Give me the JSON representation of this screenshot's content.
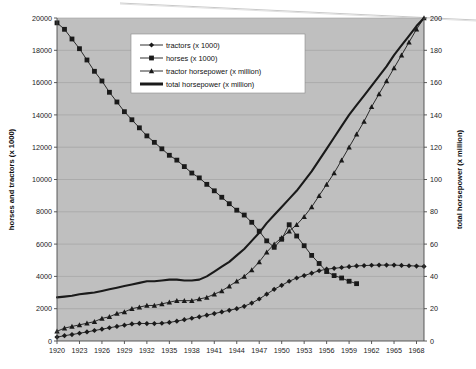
{
  "figure": {
    "name": "farm-power-chart",
    "background": "#ffffff",
    "plot_background": "#bfbfbf",
    "line_color": "#1a1a1a",
    "grid_color": "#9e9e9e",
    "axis_color": "#4a4a4a"
  },
  "legend": {
    "position": "top-center-inside",
    "background": "#ffffff",
    "items": [
      {
        "label": "tractors (x 1000)",
        "marker": "diamond-marker",
        "series": "tractors"
      },
      {
        "label": "horses (x 1000)",
        "marker": "square-marker",
        "series": "horses"
      },
      {
        "label": "tractor horsepower (x million)",
        "marker": "triangle-marker",
        "series": "tractor_horsepower"
      },
      {
        "label": "total horsepower (x million)",
        "marker": "thick-line-marker",
        "series": "total_horsepower"
      }
    ]
  },
  "chart_data": {
    "type": "line",
    "title": "",
    "subtitle": "",
    "xlabel": "",
    "ylabel": "horses and tractors (x 1000)",
    "y2label": "total horsepower (x million)",
    "ylim": [
      0,
      20000
    ],
    "y2lim": [
      0,
      200
    ],
    "xlim": [
      1920,
      1969
    ],
    "grid": true,
    "grid_axis": "y",
    "legend_position": "upper center",
    "y_ticks": [
      0,
      2000,
      4000,
      6000,
      8000,
      10000,
      12000,
      14000,
      16000,
      18000,
      20000
    ],
    "y_tick_labels": [
      "0",
      "2000",
      "4000",
      "6000",
      "8000",
      "10000",
      "12000",
      "14000",
      "16000",
      "18000",
      "20000"
    ],
    "y2_ticks": [
      0,
      20,
      40,
      60,
      80,
      100,
      120,
      140,
      160,
      180,
      200
    ],
    "y2_tick_labels": [
      "0",
      "20",
      "40",
      "60",
      "80",
      "100",
      "120",
      "140",
      "160",
      "180",
      "200"
    ],
    "x_tick_labels": [
      "1920",
      "1923",
      "1926",
      "1929",
      "1932",
      "1935",
      "1938",
      "1941",
      "1944",
      "1947",
      "1950",
      "1953",
      "1956",
      "1959",
      "1962",
      "1965",
      "1968"
    ],
    "x_tick_values": [
      1920,
      1923,
      1926,
      1929,
      1932,
      1935,
      1938,
      1941,
      1944,
      1947,
      1950,
      1953,
      1956,
      1959,
      1962,
      1965,
      1968
    ],
    "x": [
      1920,
      1921,
      1922,
      1923,
      1924,
      1925,
      1926,
      1927,
      1928,
      1929,
      1930,
      1931,
      1932,
      1933,
      1934,
      1935,
      1936,
      1937,
      1938,
      1939,
      1940,
      1941,
      1942,
      1943,
      1944,
      1945,
      1946,
      1947,
      1948,
      1949,
      1950,
      1951,
      1952,
      1953,
      1954,
      1955,
      1956,
      1957,
      1958,
      1959,
      1960,
      1961,
      1962,
      1963,
      1964,
      1965,
      1966,
      1967,
      1968,
      1969
    ],
    "series": [
      {
        "name": "tractors (x 1000)",
        "axis": "left",
        "marker": "diamond",
        "values": [
          240,
          330,
          400,
          480,
          560,
          650,
          730,
          820,
          900,
          980,
          1060,
          1090,
          1080,
          1080,
          1100,
          1150,
          1230,
          1320,
          1410,
          1500,
          1600,
          1700,
          1800,
          1900,
          2000,
          2150,
          2350,
          2600,
          2900,
          3200,
          3450,
          3700,
          3900,
          4050,
          4200,
          4350,
          4450,
          4500,
          4550,
          4600,
          4650,
          4670,
          4690,
          4700,
          4700,
          4700,
          4680,
          4660,
          4640,
          4620
        ]
      },
      {
        "name": "horses (x 1000)",
        "axis": "left",
        "marker": "square",
        "values": [
          19700,
          19300,
          18700,
          18100,
          17400,
          16700,
          16100,
          15400,
          14800,
          14200,
          13700,
          13200,
          12700,
          12300,
          11900,
          11500,
          11200,
          10800,
          10400,
          10100,
          9700,
          9300,
          8900,
          8500,
          8100,
          7800,
          7350,
          6800,
          6200,
          5800,
          6300,
          7200,
          6500,
          5900,
          5300,
          4800,
          4300,
          4050,
          3900,
          3700,
          3550,
          null,
          null,
          null,
          null,
          null,
          null,
          null,
          null,
          null
        ]
      },
      {
        "name": "tractor horsepower (x million)",
        "axis": "right",
        "marker": "triangle",
        "values": [
          6,
          8,
          9,
          10,
          11,
          12,
          14,
          15,
          17,
          18,
          20,
          21,
          22,
          22,
          23,
          24,
          25,
          25,
          25,
          26,
          27,
          29,
          31,
          34,
          37,
          40,
          44,
          49,
          55,
          60,
          64,
          68,
          72,
          77,
          83,
          90,
          97,
          104,
          112,
          120,
          128,
          136,
          145,
          153,
          161,
          169,
          177,
          185,
          193,
          200
        ]
      },
      {
        "name": "total horsepower (x million)",
        "axis": "right",
        "marker": "none",
        "values": [
          27,
          27.5,
          28,
          29,
          29.5,
          30,
          31,
          32,
          33,
          34,
          35,
          36,
          37,
          37,
          37.5,
          38,
          38,
          37.5,
          37.5,
          38,
          40,
          43,
          46,
          49,
          53,
          57,
          62,
          67,
          73,
          78,
          83,
          88,
          93,
          99,
          105,
          112,
          119,
          126,
          133,
          140,
          146,
          152,
          158,
          164,
          170,
          177,
          183,
          189,
          195,
          200
        ]
      }
    ]
  }
}
